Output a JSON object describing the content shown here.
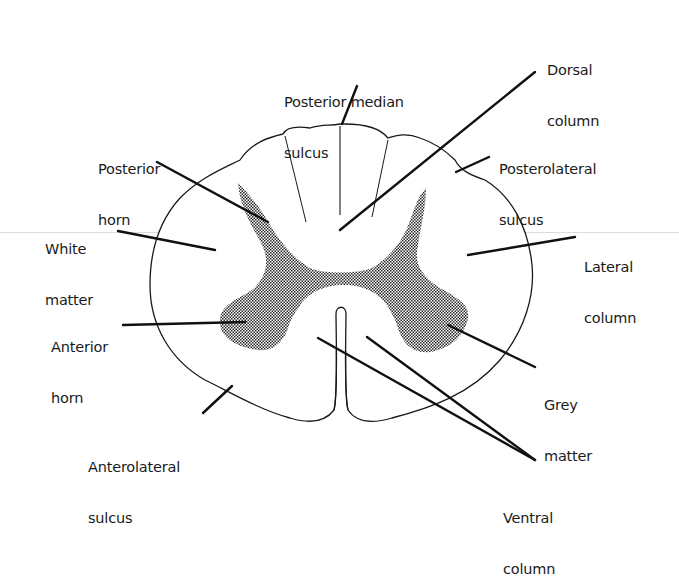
{
  "diagram": {
    "colors": {
      "outline": "#1a1a1a",
      "leader": "#111111",
      "grey_matter_fill": "#555555",
      "background": "#ffffff"
    },
    "labels": [
      {
        "id": "posterior-median-sulcus",
        "lines": [
          "Posterior median",
          "sulcus"
        ]
      },
      {
        "id": "dorsal-column",
        "lines": [
          "Dorsal",
          "column"
        ]
      },
      {
        "id": "posterior-horn",
        "lines": [
          "Posterior",
          "horn"
        ]
      },
      {
        "id": "posterolateral-sulcus",
        "lines": [
          "Posterolateral",
          "sulcus"
        ]
      },
      {
        "id": "white-matter",
        "lines": [
          "White",
          "matter"
        ]
      },
      {
        "id": "lateral-column",
        "lines": [
          "Lateral",
          "column"
        ]
      },
      {
        "id": "anterior-horn",
        "lines": [
          "Anterior",
          "horn"
        ]
      },
      {
        "id": "grey-matter",
        "lines": [
          "Grey",
          "matter"
        ]
      },
      {
        "id": "anterolateral-sulcus",
        "lines": [
          "Anterolateral",
          "sulcus"
        ]
      },
      {
        "id": "ventral-column",
        "lines": [
          "Ventral",
          "column"
        ]
      }
    ]
  }
}
